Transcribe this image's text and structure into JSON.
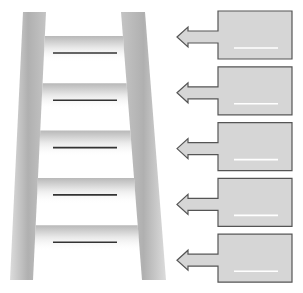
{
  "diagram": {
    "type": "ladder-with-callouts",
    "ladder": {
      "rung_count": 5,
      "rungs": [
        {
          "index": 1,
          "label": ""
        },
        {
          "index": 2,
          "label": ""
        },
        {
          "index": 3,
          "label": ""
        },
        {
          "index": 4,
          "label": ""
        },
        {
          "index": 5,
          "label": ""
        }
      ]
    },
    "callouts": [
      {
        "index": 1,
        "text": "",
        "arrow_direction": "left"
      },
      {
        "index": 2,
        "text": "",
        "arrow_direction": "left"
      },
      {
        "index": 3,
        "text": "",
        "arrow_direction": "left"
      },
      {
        "index": 4,
        "text": "",
        "arrow_direction": "left"
      },
      {
        "index": 5,
        "text": "",
        "arrow_direction": "left"
      }
    ],
    "colors": {
      "rail": "#b4b4b4",
      "rail_light": "#e6e6e6",
      "rung_line": "#333333",
      "callout_fill": "#d6d6d6",
      "callout_stroke": "#555555",
      "callout_line": "#ffffff"
    }
  }
}
